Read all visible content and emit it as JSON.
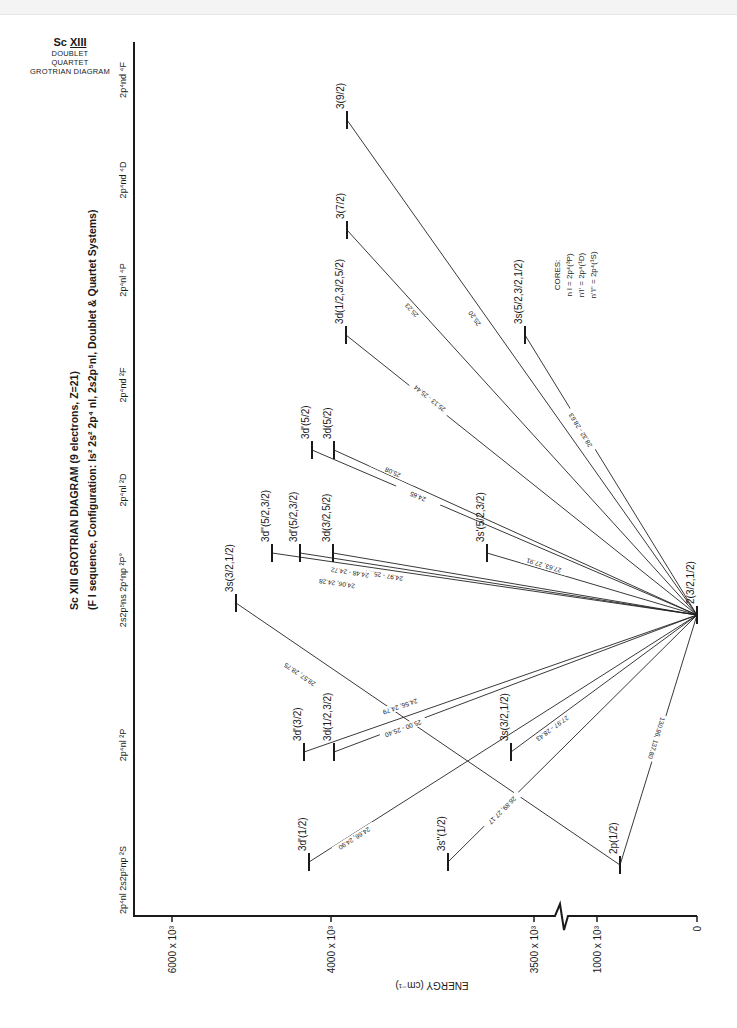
{
  "corner_title": {
    "ion": "Sc",
    "charge": "XIII",
    "lines": [
      "DOUBLET",
      "QUARTET",
      "GROTRIAN DIAGRAM"
    ]
  },
  "title": {
    "line1": "Sc XIII GROTRIAN DIAGRAM (9 electrons, Z=21)",
    "line2": "(F I sequence, Configuration: ls² 2s² 2p⁴ nl, 2s2p⁵nl, Doublet & Quartet Systems)"
  },
  "energy_axis": {
    "label": "ENERGY (cm⁻¹)",
    "ticks": [
      {
        "label": "6000 x 10³",
        "x": 172
      },
      {
        "label": "4000 x 10³",
        "x": 331
      },
      {
        "label": "3500 x 10³",
        "x": 534
      },
      {
        "label": "1000 x 10³",
        "x": 597
      },
      {
        "label": "0",
        "x": 697
      }
    ],
    "break_x": 563
  },
  "columns": [
    {
      "label": "2p⁴nl  2s2p⁵np ²S",
      "y": 880
    },
    {
      "label": "2p⁴nl ²P",
      "y": 745
    },
    {
      "label": "2s2p⁵ns 2p⁴np ²P°",
      "y": 590
    },
    {
      "label": "2p⁴nl ²D",
      "y": 490
    },
    {
      "label": "2p⁴nd ²F",
      "y": 385
    },
    {
      "label": "2p⁴nl ⁴P",
      "y": 280
    },
    {
      "label": "2p⁴nd ⁴D",
      "y": 180
    },
    {
      "label": "2p⁴nd ⁴F",
      "y": 80
    }
  ],
  "levels": [
    {
      "id": "g",
      "label": "2(3/2,1/2)",
      "x": 697,
      "y": 615
    },
    {
      "id": "2p",
      "label": "2p(1/2)",
      "x": 620,
      "y": 865
    },
    {
      "id": "3dp_S",
      "label": "3d'(1/2)",
      "x": 309,
      "y": 862
    },
    {
      "id": "3spp_S",
      "label": "3s''(1/2)",
      "x": 448,
      "y": 862
    },
    {
      "id": "3dp_P",
      "label": "3d'(3/2)",
      "x": 304,
      "y": 752
    },
    {
      "id": "3d_P",
      "label": "3d(1/2,3/2)",
      "x": 334,
      "y": 752
    },
    {
      "id": "3s_P",
      "label": "3s(3/2,1/2)",
      "x": 511,
      "y": 752
    },
    {
      "id": "3s_Po",
      "label": "3s(3/2,1/2)",
      "x": 236,
      "y": 603
    },
    {
      "id": "3dpp_D",
      "label": "3d''(5/2,3/2)",
      "x": 272,
      "y": 553
    },
    {
      "id": "3dp_D",
      "label": "3d'(5/2,3/2)",
      "x": 300,
      "y": 553
    },
    {
      "id": "3d_D",
      "label": "3d(3/2,5/2)",
      "x": 333,
      "y": 553
    },
    {
      "id": "3sp_D",
      "label": "3s'(5/2,3/2)",
      "x": 487,
      "y": 553
    },
    {
      "id": "3dp_F",
      "label": "3d'(5/2)",
      "x": 312,
      "y": 450
    },
    {
      "id": "3d_F",
      "label": "3d(5/2)",
      "x": 334,
      "y": 450
    },
    {
      "id": "3d_4P",
      "label": "3d(1/2,3/2,5/2)",
      "x": 346,
      "y": 335
    },
    {
      "id": "3s_4P",
      "label": "3s(5/2,3/2,1/2)",
      "x": 525,
      "y": 335
    },
    {
      "id": "3_4D",
      "label": "3(7/2)",
      "x": 347,
      "y": 230
    },
    {
      "id": "3_4F",
      "label": "3(9/2)",
      "x": 347,
      "y": 120
    }
  ],
  "transitions": [
    {
      "from": "3_4F",
      "to": "g",
      "wl": "25.20",
      "lx": 475,
      "ly": 318
    },
    {
      "from": "3_4D",
      "to": "g",
      "wl": "25.23",
      "lx": 412,
      "ly": 310
    },
    {
      "from": "3d_4P",
      "to": "g",
      "wl": "25.13 - 25.44",
      "lx": 430,
      "ly": 398
    },
    {
      "from": "3s_4P",
      "to": "g",
      "wl": "28.32 - 28.63",
      "lx": 581,
      "ly": 430
    },
    {
      "from": "3d_F",
      "to": "g",
      "wl": "25.08",
      "lx": 393,
      "ly": 472
    },
    {
      "from": "3dp_F",
      "to": "g",
      "wl": "24.65",
      "lx": 418,
      "ly": 496
    },
    {
      "from": "3sp_D",
      "to": "g",
      "wl": "27.63, 27.91",
      "lx": 544,
      "ly": 565
    },
    {
      "from": "3d_D",
      "to": "g",
      "wl": "24.97 - 25.34",
      "lx": 384,
      "ly": 575
    },
    {
      "from": "3dp_D",
      "to": "g",
      "wl": "24.48 - 24.72",
      "lx": 350,
      "ly": 572
    },
    {
      "from": "3dpp_D",
      "to": "g",
      "wl": "24.06, 24.28",
      "lx": 337,
      "ly": 583
    },
    {
      "from": "3s_Po",
      "to": "2p",
      "wl": "28.57, 28.75",
      "lx": 300,
      "ly": 674
    },
    {
      "from": "3dp_P",
      "to": "g",
      "wl": "24.56, 24.79",
      "lx": 400,
      "ly": 706
    },
    {
      "from": "3d_P",
      "to": "g",
      "wl": "25.00 - 25.40",
      "lx": 403,
      "ly": 728
    },
    {
      "from": "3s_P",
      "to": "g",
      "wl": "27.97 - 28.43",
      "lx": 552,
      "ly": 728
    },
    {
      "from": "3dp_S",
      "to": "g",
      "wl": "24.66, 24.90",
      "lx": 354,
      "ly": 838
    },
    {
      "from": "3spp_S",
      "to": "g",
      "wl": "26.89, 27.17",
      "lx": 502,
      "ly": 810
    },
    {
      "from": "2p",
      "to": "g",
      "wl": "130.96, 137.80",
      "lx": 656,
      "ly": 738
    }
  ],
  "cores": {
    "title": "CORES:",
    "lines": [
      "n l = 2p⁴(³P)",
      "n'l' = 2p⁴(¹D)",
      "n''l'' = 2p⁴(¹S)"
    ]
  }
}
